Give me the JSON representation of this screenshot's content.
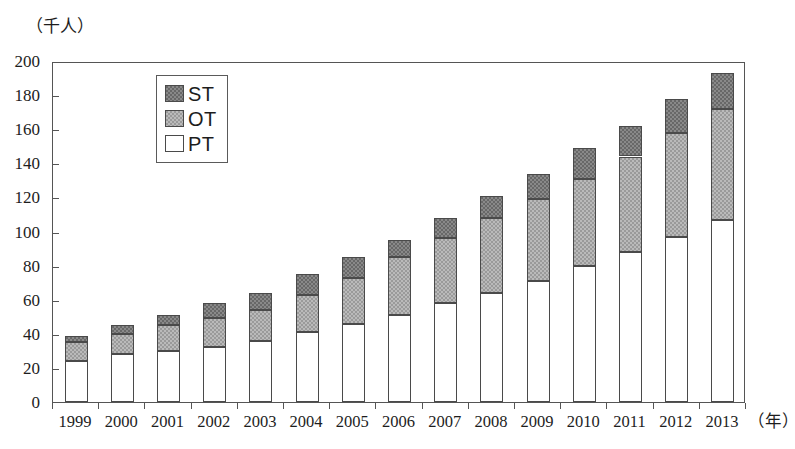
{
  "chart_data": {
    "type": "bar",
    "subtype": "stacked-vertical",
    "title": "",
    "subtitle": "",
    "xlabel": "（年）",
    "ylabel": "（千人）",
    "y_unit_caption": "（千人）",
    "x_unit_caption": "（年）",
    "grid": false,
    "legend_position": "top-left-inside",
    "ylim": [
      0,
      200
    ],
    "yticks": [
      0,
      20,
      40,
      60,
      80,
      100,
      120,
      140,
      160,
      180,
      200
    ],
    "ytick_labels": [
      "0",
      "20",
      "40",
      "60",
      "80",
      "100",
      "120",
      "140",
      "160",
      "180",
      "200"
    ],
    "categories": [
      "1999",
      "2000",
      "2001",
      "2002",
      "2003",
      "2004",
      "2005",
      "2006",
      "2007",
      "2008",
      "2009",
      "2010",
      "2011",
      "2012",
      "2013"
    ],
    "series": [
      {
        "name": "PT",
        "legend_label": "PT",
        "color": "#ffffff",
        "stack_order": 1,
        "values": [
          24,
          28,
          30,
          32,
          36,
          41,
          46,
          51,
          58,
          64,
          71,
          80,
          88,
          97,
          107
        ]
      },
      {
        "name": "OT",
        "legend_label": "OT",
        "color": "#9a9a9a",
        "stack_order": 2,
        "values": [
          11,
          12,
          15,
          17,
          18,
          22,
          27,
          34,
          38,
          44,
          48,
          51,
          56,
          61,
          65
        ]
      },
      {
        "name": "ST",
        "legend_label": "ST",
        "color": "#686868",
        "stack_order": 3,
        "values": [
          4,
          5,
          6,
          9,
          10,
          12,
          12,
          10,
          12,
          13,
          15,
          18,
          18,
          20,
          21
        ]
      }
    ],
    "totals": [
      39,
      45,
      51,
      58,
      64,
      75,
      85,
      95,
      108,
      121,
      134,
      149,
      162,
      178,
      193
    ],
    "annotations": []
  },
  "legend": {
    "rows": [
      {
        "label": "ST",
        "swatch": "dark-gray-hatch"
      },
      {
        "label": "OT",
        "swatch": "medium-gray-hatch"
      },
      {
        "label": "PT",
        "swatch": "white"
      }
    ]
  },
  "colors": {
    "pt": "#ffffff",
    "ot": "#9a9a9a",
    "st": "#686868",
    "axis": "#555555",
    "text": "#1d1d1d"
  }
}
